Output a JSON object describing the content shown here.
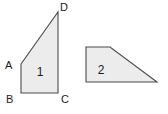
{
  "canvas": {
    "width": 168,
    "height": 114,
    "background": "#ffffff"
  },
  "style": {
    "shape_fill": "#ececec",
    "shape_stroke": "#4a4a4a",
    "label_color": "#1b1b1b"
  },
  "figures": [
    {
      "id": "figure-1",
      "number_label": "1",
      "kind": "quadrilateral",
      "number_label_position": {
        "x": 40,
        "y": 72
      },
      "points": "21,64 58,12 58,93 21,93",
      "vertices": [
        {
          "name": "A",
          "label": "A",
          "x": 21,
          "y": 64,
          "label_x": 8,
          "label_y": 68
        },
        {
          "name": "D",
          "label": "D",
          "x": 58,
          "y": 12,
          "label_x": 60,
          "label_y": 11
        },
        {
          "name": "C",
          "label": "C",
          "x": 58,
          "y": 93,
          "label_x": 60,
          "label_y": 102
        },
        {
          "name": "B",
          "label": "B",
          "x": 21,
          "y": 93,
          "label_x": 9,
          "label_y": 102
        }
      ]
    },
    {
      "id": "figure-2",
      "number_label": "2",
      "kind": "trapezoid",
      "number_label_position": {
        "x": 101,
        "y": 70
      },
      "points": "86,47 110,47 157,82 86,82",
      "vertices": []
    }
  ]
}
